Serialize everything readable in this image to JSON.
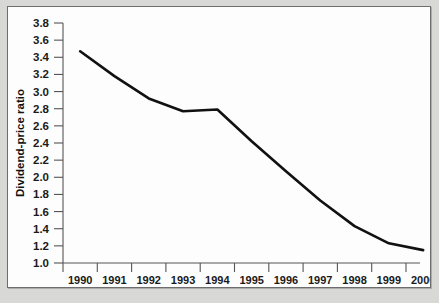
{
  "figure": {
    "background_color": "#d8d8d6",
    "panel_color": "#fdfdfd",
    "border_color": "#6d6d6d",
    "line_color": "#111111",
    "axis_color": "#555555"
  },
  "chart_data": {
    "type": "line",
    "title": "",
    "xlabel": "",
    "ylabel": "Dividend-price ratio",
    "categories": [
      "1990",
      "1991",
      "1992",
      "1993",
      "1994",
      "1995",
      "1996",
      "1997",
      "1998",
      "1999",
      "2000"
    ],
    "x": [
      1990,
      1991,
      1992,
      1993,
      1994,
      1995,
      1996,
      1997,
      1998,
      1999,
      2000
    ],
    "values": [
      3.47,
      3.18,
      2.92,
      2.77,
      2.79,
      2.42,
      2.07,
      1.73,
      1.43,
      1.23,
      1.15
    ],
    "series": [
      {
        "name": "Dividend-price ratio",
        "values": [
          3.47,
          3.18,
          2.92,
          2.77,
          2.79,
          2.42,
          2.07,
          1.73,
          1.43,
          1.23,
          1.15
        ]
      }
    ],
    "ylim": [
      1.0,
      3.8
    ],
    "xlim": [
      1990,
      2000
    ],
    "ytick_labels": [
      "3.8",
      "3.6",
      "3.4",
      "3.2",
      "3.0",
      "2.8",
      "2.6",
      "2.4",
      "2.2",
      "2.0",
      "1.8",
      "1.6",
      "1.4",
      "1.2",
      "1.0"
    ],
    "ytick_values": [
      3.8,
      3.6,
      3.4,
      3.2,
      3.0,
      2.8,
      2.6,
      2.4,
      2.2,
      2.0,
      1.8,
      1.6,
      1.4,
      1.2,
      1.0
    ],
    "xtick_labels": [
      "1990",
      "1991",
      "1992",
      "1993",
      "1994",
      "1995",
      "1996",
      "1997",
      "1998",
      "1999",
      "2000"
    ],
    "grid": false,
    "legend": false,
    "legend_position": "none"
  }
}
